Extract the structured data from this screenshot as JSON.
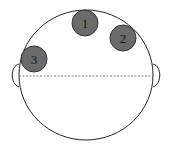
{
  "diagram": {
    "type": "head-top-view",
    "colors": {
      "outline": "#222222",
      "marker_fill": "#6b6b6b",
      "marker_stroke": "#333333",
      "midline": "#555555"
    },
    "markers": [
      {
        "label": "1",
        "cx": 85,
        "cy": 23
      },
      {
        "label": "2",
        "cx": 123,
        "cy": 38
      },
      {
        "label": "3",
        "cx": 34,
        "cy": 59
      }
    ]
  }
}
